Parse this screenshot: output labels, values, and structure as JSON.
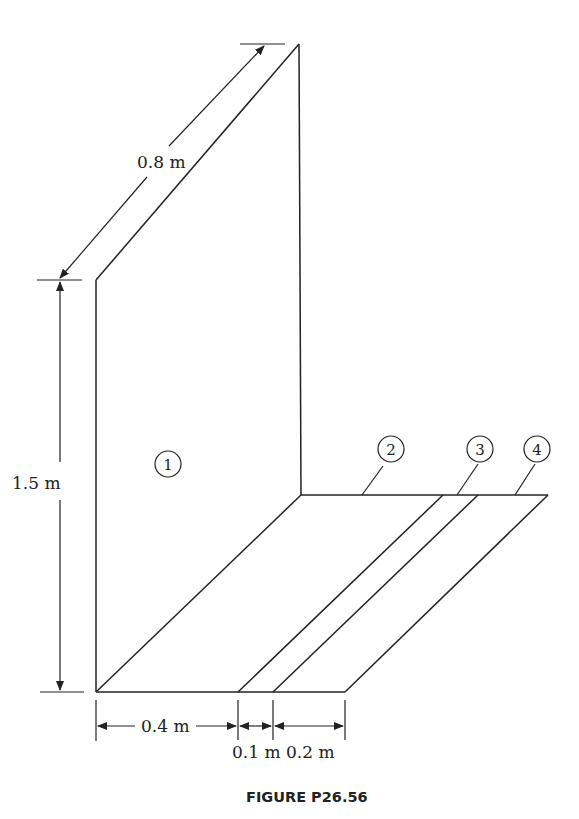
{
  "figure": {
    "caption": "FIGURE P26.56",
    "dimensions": {
      "depth": "0.8 m",
      "height": "1.5 m",
      "width_1": "0.4 m",
      "width_2": "0.1 m",
      "width_3": "0.2 m"
    },
    "surfaces": [
      {
        "id": "surface-1",
        "label": "1"
      },
      {
        "id": "surface-2",
        "label": "2"
      },
      {
        "id": "surface-3",
        "label": "3"
      },
      {
        "id": "surface-4",
        "label": "4"
      }
    ]
  }
}
